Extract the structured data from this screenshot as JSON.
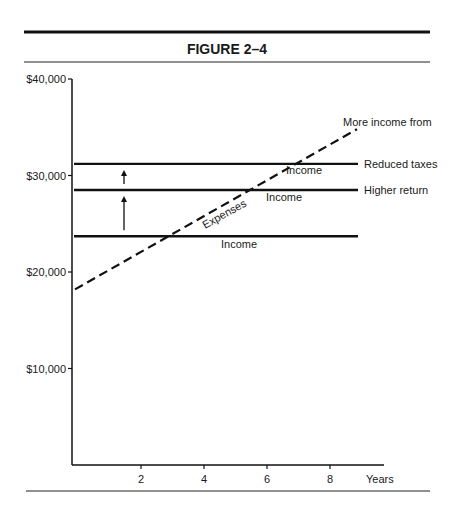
{
  "figure": {
    "title": "FIGURE 2–4"
  },
  "chart_data": {
    "type": "line",
    "title": "FIGURE 2–4",
    "xlabel": "Years",
    "ylabel": "",
    "xlim": [
      0,
      9
    ],
    "ylim": [
      0,
      40000
    ],
    "x_ticks": [
      2,
      4,
      6,
      8
    ],
    "x_tick_labels": [
      "2",
      "4",
      "6",
      "8"
    ],
    "y_ticks": [
      10000,
      20000,
      30000,
      40000
    ],
    "y_tick_labels": [
      "$10,000",
      "$20,000",
      "$30,000",
      "$40,000"
    ],
    "grid": false,
    "legend": "none",
    "series": [
      {
        "name": "Income (reduced taxes)",
        "style": "solid",
        "x": [
          0,
          9
        ],
        "y": [
          31200,
          31200
        ],
        "end_label": "Reduced taxes",
        "inline_label": "Income"
      },
      {
        "name": "Income (higher return)",
        "style": "solid",
        "x": [
          0,
          9
        ],
        "y": [
          28500,
          28500
        ],
        "end_label": "Higher return",
        "inline_label": "Income"
      },
      {
        "name": "Income",
        "style": "solid",
        "x": [
          0,
          8.8
        ],
        "y": [
          23700,
          23700
        ],
        "inline_label": "Income"
      },
      {
        "name": "Expenses",
        "style": "dashed",
        "x": [
          0,
          8.8
        ],
        "y": [
          18200,
          34800
        ],
        "inline_label": "Expenses"
      }
    ],
    "annotations": [
      {
        "text": "More income from",
        "x": 8.3,
        "y": 36000
      },
      {
        "type": "arrow",
        "x": 1.5,
        "from": 23700,
        "to": 28500
      },
      {
        "type": "arrow",
        "x": 1.5,
        "from": 28500,
        "to": 31200
      }
    ]
  }
}
